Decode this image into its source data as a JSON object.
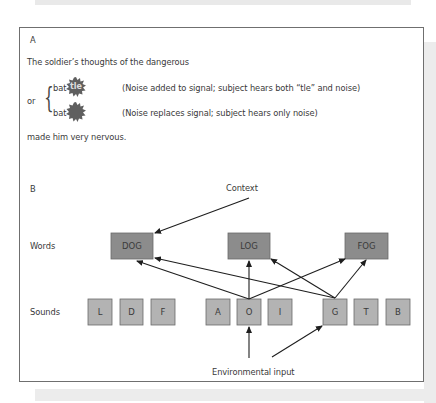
{
  "panel_a": {
    "label": "A",
    "line1": "The soldier’s thoughts of the dangerous",
    "or": "or",
    "option1": {
      "word": "bat",
      "noise_text": "tle",
      "caption": "(Noise added to signal; subject hears both “tle” and noise)"
    },
    "option2": {
      "word": "bat",
      "caption": "(Noise replaces signal; subject hears only noise)"
    },
    "line_end": "made him very nervous."
  },
  "panel_b": {
    "label": "B",
    "context_label": "Context",
    "environment_label": "Environmental input",
    "row_words_label": "Words",
    "row_sounds_label": "Sounds",
    "words": [
      "DOG",
      "LOG",
      "FOG"
    ],
    "sounds": [
      "L",
      "D",
      "F",
      "A",
      "O",
      "I",
      "G",
      "T",
      "B"
    ],
    "colors": {
      "word_fill": "#8c8c8c",
      "sound_fill": "#b3b3b3",
      "border": "#6a6a6a",
      "arrow": "#1e1e1e"
    }
  }
}
